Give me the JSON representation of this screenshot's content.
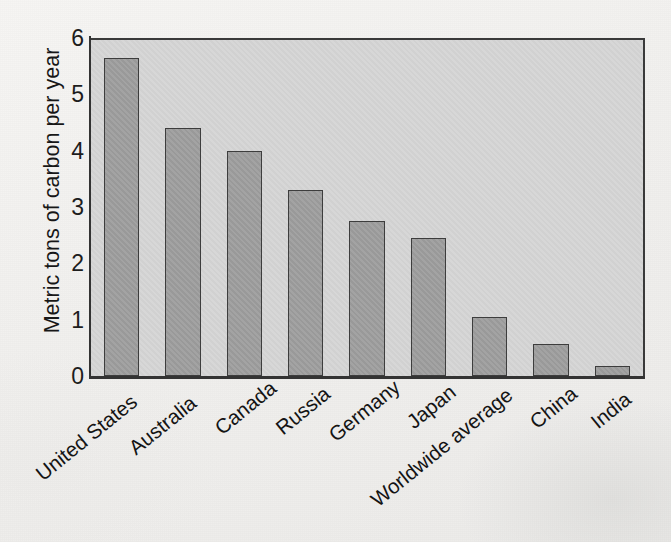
{
  "chart_data": {
    "type": "bar",
    "title": "",
    "subtitle": "",
    "xlabel": "",
    "ylabel": "Metric tons of carbon per year",
    "ylim": [
      0,
      6
    ],
    "yticks": [
      "0",
      "1",
      "2",
      "3",
      "4",
      "5",
      "6"
    ],
    "grid": false,
    "legend": false,
    "legend_position": "none",
    "orientation": "vertical",
    "categories": [
      "United States",
      "Australia",
      "Canada",
      "Russia",
      "Germany",
      "Japan",
      "Worldwide average",
      "China",
      "India"
    ],
    "values": [
      5.65,
      4.4,
      4.0,
      3.3,
      2.75,
      2.45,
      1.05,
      0.57,
      0.18
    ],
    "annotations": []
  },
  "style": {
    "page_background": "#f4f3f1",
    "plot_background": "#d3d3d3",
    "bar_fill": "#9c9c9c",
    "bar_outline": "#3d3d3d",
    "axis_color": "#333333",
    "text_color": "#141414"
  }
}
